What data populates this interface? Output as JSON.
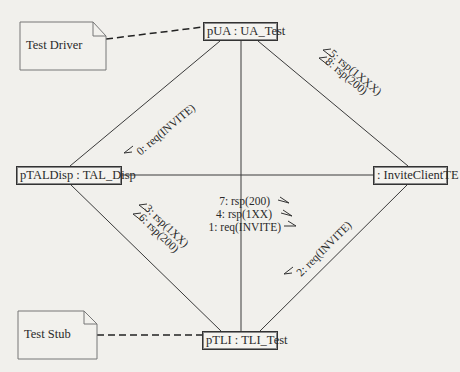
{
  "diagram": {
    "type": "UML communication diagram",
    "objects": [
      {
        "id": "pUA",
        "label": "pUA : UA_Test"
      },
      {
        "id": "pTALDisp",
        "label": "pTALDisp : TAL_Disp"
      },
      {
        "id": "InviteClientTE",
        "label": ": InviteClientTE"
      },
      {
        "id": "pTLI",
        "label": "pTLI : TLI_Test"
      }
    ],
    "notes": [
      {
        "id": "test-driver",
        "label": "Test Driver",
        "attached_to": "pUA"
      },
      {
        "id": "test-stub",
        "label": "Test Stub",
        "attached_to": "pTLI"
      }
    ],
    "links": [
      {
        "from": "pUA",
        "to": "pTALDisp"
      },
      {
        "from": "pUA",
        "to": "InviteClientTE"
      },
      {
        "from": "pUA",
        "to": "pTLI"
      },
      {
        "from": "pTALDisp",
        "to": "InviteClientTE"
      },
      {
        "from": "pTALDisp",
        "to": "pTLI"
      },
      {
        "from": "InviteClientTE",
        "to": "pTLI"
      }
    ],
    "messages": {
      "ua_tal": [
        "0: req(INVITE)"
      ],
      "ua_ict": [
        "5: rsp(1XXX)",
        "8: rsp(200)"
      ],
      "tal_tli": [
        "3: rsp(1XX)",
        "6: rsp(200)"
      ],
      "ict_tli": [
        "2: req(INVITE)"
      ],
      "center": [
        "7: rsp(200)",
        "4: rsp(1XX)",
        "1: req(INVITE)"
      ]
    }
  },
  "colors": {
    "background": "#f1f0ec",
    "line": "#3a3a3a",
    "text": "#2a2a2a"
  }
}
